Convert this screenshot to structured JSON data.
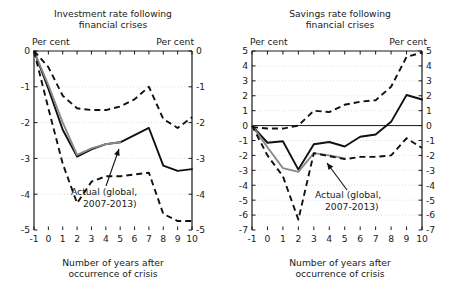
{
  "figure": {
    "axis_label": "Number of years after occurrence of crisis",
    "unit_label_left": "Per cent",
    "unit_label_right": "Per cent",
    "annotation_line1": "Actual (global,",
    "annotation_line2": "2007-2013)"
  },
  "colors": {
    "ink": "#111111",
    "gray_series": "#8a8a8a",
    "grid": "#d8d8d8"
  },
  "chart_data": [
    {
      "type": "line",
      "id": "investment",
      "title": "Investment rate following financial crises",
      "title_line1": "Investment rate following",
      "title_line2": "financial crises",
      "xlabel": "Number of years after occurrence of crisis",
      "ylabel": "Per cent",
      "xlim": [
        -1,
        10
      ],
      "ylim": [
        -5,
        0
      ],
      "xticks": [
        -1,
        0,
        1,
        2,
        3,
        4,
        5,
        6,
        7,
        8,
        9,
        10
      ],
      "xticklabels": [
        "-1",
        "0",
        "1",
        "2",
        "3",
        "4",
        "5",
        "6",
        "7",
        "8",
        "9",
        "10"
      ],
      "yticks": [
        0,
        -1,
        -2,
        -3,
        -4,
        -5
      ],
      "yticklabels": [
        "0",
        "-1",
        "-2",
        "-3",
        "-4",
        "-5"
      ],
      "grid": true,
      "legend": "none",
      "x": [
        -1,
        0,
        1,
        2,
        3,
        4,
        5,
        6,
        7,
        8,
        9,
        10
      ],
      "series": [
        {
          "name": "median",
          "style": "solid-black",
          "values": [
            0,
            -1.05,
            -2.2,
            -2.95,
            -2.75,
            -2.6,
            -2.55,
            -2.35,
            -2.15,
            -3.2,
            -3.35,
            -3.3
          ]
        },
        {
          "name": "actual-global-2007-2013",
          "style": "solid-gray",
          "values": [
            0,
            -0.95,
            -2.0,
            -2.9,
            -2.72,
            -2.6,
            -2.55,
            null,
            null,
            null,
            null,
            null
          ]
        },
        {
          "name": "upper-band",
          "style": "dashed",
          "values": [
            0,
            -0.45,
            -1.25,
            -1.6,
            -1.65,
            -1.65,
            -1.55,
            -1.35,
            -1.0,
            -1.9,
            -2.15,
            -1.85
          ]
        },
        {
          "name": "lower-band",
          "style": "dashed",
          "values": [
            0,
            -1.6,
            -3.15,
            -4.25,
            -3.65,
            -3.5,
            -3.5,
            -3.45,
            -3.4,
            -4.55,
            -4.75,
            -4.75
          ]
        }
      ]
    },
    {
      "type": "line",
      "id": "savings",
      "title": "Savings rate following financial crises",
      "title_line1": "Savings rate following",
      "title_line2": "financial crises",
      "xlabel": "Number of years after occurrence of crisis",
      "ylabel": "Per cent",
      "xlim": [
        -1,
        10
      ],
      "ylim": [
        -7,
        5
      ],
      "xticks": [
        -1,
        0,
        1,
        2,
        3,
        4,
        5,
        6,
        7,
        8,
        9,
        10
      ],
      "xticklabels": [
        "-1",
        "0",
        "1",
        "2",
        "3",
        "4",
        "5",
        "6",
        "7",
        "8",
        "9",
        "10"
      ],
      "yticks": [
        5,
        4,
        3,
        2,
        1,
        0,
        -1,
        -2,
        -3,
        -4,
        -5,
        -6,
        -7
      ],
      "yticklabels": [
        "5",
        "4",
        "3",
        "2",
        "1",
        "0",
        "-1",
        "-2",
        "-3",
        "-4",
        "-5",
        "-6",
        "-7"
      ],
      "grid": true,
      "legend": "none",
      "x": [
        -1,
        0,
        1,
        2,
        3,
        4,
        5,
        6,
        7,
        8,
        9,
        10
      ],
      "series": [
        {
          "name": "median",
          "style": "solid-black",
          "values": [
            0,
            -1.15,
            -1.05,
            -2.95,
            -1.25,
            -1.1,
            -1.4,
            -0.75,
            -0.6,
            0.25,
            2.05,
            1.75
          ]
        },
        {
          "name": "actual-global-2007-2013",
          "style": "solid-gray",
          "values": [
            0,
            -1.45,
            -2.85,
            -3.1,
            -1.85,
            -2.0,
            -2.2,
            null,
            null,
            null,
            null,
            null
          ]
        },
        {
          "name": "upper-band",
          "style": "dashed",
          "values": [
            -0.1,
            -0.2,
            -0.2,
            0.0,
            1.0,
            0.9,
            1.4,
            1.6,
            1.7,
            2.6,
            4.6,
            4.9
          ]
        },
        {
          "name": "lower-band",
          "style": "dashed",
          "values": [
            0,
            -2.0,
            -3.4,
            -6.3,
            -1.85,
            -2.05,
            -2.25,
            -2.1,
            -2.1,
            -2.0,
            -0.85,
            -1.5
          ]
        }
      ]
    }
  ]
}
